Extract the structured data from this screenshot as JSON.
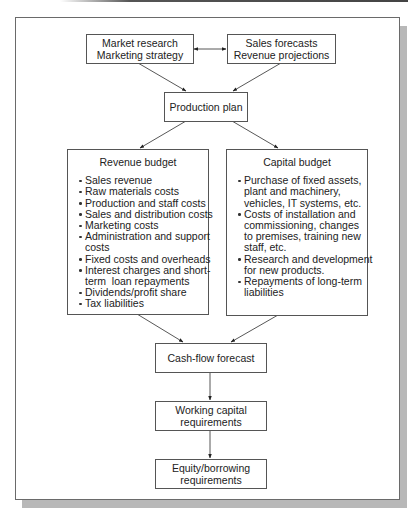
{
  "diagram": {
    "nodes": {
      "market_research": {
        "lines": [
          "Market research",
          "Marketing strategy"
        ]
      },
      "sales_forecasts": {
        "lines": [
          "Sales forecasts",
          "Revenue projections"
        ]
      },
      "production_plan": {
        "lines": [
          "Production plan"
        ]
      },
      "revenue_budget": {
        "title": "Revenue budget",
        "items": [
          [
            "Sales revenue"
          ],
          [
            "Raw materials costs"
          ],
          [
            "Production and staff costs"
          ],
          [
            "Sales and distribution costs"
          ],
          [
            "Marketing costs"
          ],
          [
            "Administration and support",
            "costs"
          ],
          [
            "Fixed costs and overheads"
          ],
          [
            "Interest charges and short-",
            "term  loan repayments"
          ],
          [
            "Dividends/profit share"
          ],
          [
            "Tax liabilities"
          ]
        ]
      },
      "capital_budget": {
        "title": "Capital budget",
        "items": [
          [
            "Purchase of fixed assets,",
            "plant and machinery,",
            "vehicles, IT systems, etc."
          ],
          [
            "Costs of installation and",
            "commissioning, changes",
            "to premises, training new",
            "staff, etc."
          ],
          [
            "Research and development",
            "for new products."
          ],
          [
            "Repayments of long-term",
            "liabilities"
          ]
        ]
      },
      "cash_flow_forecast": {
        "lines": [
          "Cash-flow forecast"
        ]
      },
      "working_capital": {
        "lines": [
          "Working capital",
          "requirements"
        ]
      },
      "equity_borrowing": {
        "lines": [
          "Equity/borrowing",
          "requirements"
        ]
      }
    },
    "edges": [
      {
        "from": "market_research",
        "to": "sales_forecasts",
        "type": "bidirectional"
      },
      {
        "from": "market_research",
        "to": "production_plan",
        "type": "arrow"
      },
      {
        "from": "sales_forecasts",
        "to": "production_plan",
        "type": "arrow"
      },
      {
        "from": "production_plan",
        "to": "revenue_budget",
        "type": "arrow"
      },
      {
        "from": "production_plan",
        "to": "capital_budget",
        "type": "arrow"
      },
      {
        "from": "revenue_budget",
        "to": "cash_flow_forecast",
        "type": "arrow"
      },
      {
        "from": "capital_budget",
        "to": "cash_flow_forecast",
        "type": "arrow"
      },
      {
        "from": "cash_flow_forecast",
        "to": "working_capital",
        "type": "arrow"
      },
      {
        "from": "working_capital",
        "to": "equity_borrowing",
        "type": "arrow"
      }
    ]
  }
}
